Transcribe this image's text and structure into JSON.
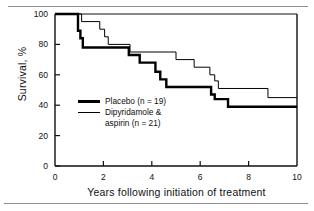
{
  "figure": {
    "top_rule": "horizontal-rule",
    "bottom_rule": "horizontal-rule"
  },
  "chart_data": {
    "type": "line",
    "subtype": "kaplan-meier-step",
    "title": "",
    "xlabel": "Years following initiation of treatment",
    "ylabel": "Survival, %",
    "xlim": [
      0,
      10
    ],
    "ylim": [
      0,
      100
    ],
    "xticks": [
      0,
      2,
      4,
      6,
      8,
      10
    ],
    "yticks": [
      0,
      20,
      40,
      60,
      80,
      100
    ],
    "xtick_labels": [
      "0",
      "2",
      "4",
      "6",
      "8",
      "10"
    ],
    "ytick_labels": [
      "0",
      "20",
      "40",
      "60",
      "80",
      "100"
    ],
    "grid": false,
    "legend_position": "inside-left-middle",
    "series": [
      {
        "name": "Placebo (n = 19)",
        "legend_label": "Placebo",
        "n_label": "(n = 19)",
        "line_style": "thick",
        "color": "#000000",
        "steps": [
          [
            0.0,
            100
          ],
          [
            0.95,
            100
          ],
          [
            0.95,
            89
          ],
          [
            1.05,
            89
          ],
          [
            1.05,
            84
          ],
          [
            1.15,
            84
          ],
          [
            1.15,
            78
          ],
          [
            3.05,
            78
          ],
          [
            3.05,
            73
          ],
          [
            3.5,
            73
          ],
          [
            3.5,
            68
          ],
          [
            4.15,
            68
          ],
          [
            4.15,
            62
          ],
          [
            4.35,
            62
          ],
          [
            4.35,
            57
          ],
          [
            4.6,
            57
          ],
          [
            4.6,
            52
          ],
          [
            6.45,
            52
          ],
          [
            6.45,
            47
          ],
          [
            6.6,
            47
          ],
          [
            6.6,
            44
          ],
          [
            7.15,
            44
          ],
          [
            7.15,
            39
          ],
          [
            10.0,
            39
          ]
        ]
      },
      {
        "name": "Dipyridamole & aspirin (n = 21)",
        "legend_label_line1": "Dipyridamole &",
        "legend_label_line2": "aspirin (n = 21)",
        "n_label": "(n = 21)",
        "line_style": "thin",
        "color": "#000000",
        "steps": [
          [
            0.0,
            100
          ],
          [
            1.1,
            100
          ],
          [
            1.1,
            95
          ],
          [
            1.85,
            95
          ],
          [
            1.85,
            90
          ],
          [
            2.05,
            90
          ],
          [
            2.05,
            85
          ],
          [
            2.2,
            85
          ],
          [
            2.2,
            80
          ],
          [
            3.1,
            80
          ],
          [
            3.1,
            75
          ],
          [
            5.0,
            75
          ],
          [
            5.0,
            70
          ],
          [
            5.75,
            70
          ],
          [
            5.75,
            65
          ],
          [
            6.4,
            65
          ],
          [
            6.4,
            60
          ],
          [
            6.6,
            60
          ],
          [
            6.6,
            56
          ],
          [
            6.75,
            56
          ],
          [
            6.75,
            51
          ],
          [
            8.8,
            51
          ],
          [
            8.8,
            45
          ],
          [
            10.0,
            45
          ]
        ]
      }
    ]
  }
}
